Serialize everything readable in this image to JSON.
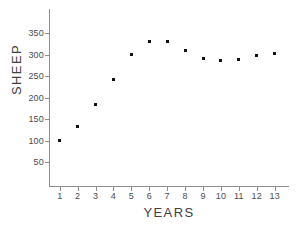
{
  "chart_data": {
    "type": "scatter",
    "title": "",
    "xlabel": "YEARS",
    "ylabel": "SHEEP",
    "x": [
      1,
      2,
      3,
      4,
      5,
      6,
      7,
      8,
      9,
      10,
      11,
      12,
      13
    ],
    "values": [
      100,
      133,
      183,
      243,
      300,
      330,
      330,
      310,
      290,
      285,
      288,
      298,
      303
    ],
    "series": [
      {
        "name": "SHEEP",
        "values": [
          100,
          133,
          183,
          243,
          300,
          330,
          330,
          310,
          290,
          285,
          288,
          298,
          303
        ]
      }
    ],
    "xlim": [
      0.4,
      13.8
    ],
    "ylim": [
      0,
      375
    ],
    "xticks": [
      1,
      2,
      3,
      4,
      5,
      6,
      7,
      8,
      9,
      10,
      11,
      12,
      13
    ],
    "xticklabels": [
      "1",
      "2",
      "3",
      "4",
      "5",
      "6",
      "7",
      "8",
      "9",
      "10",
      "11",
      "12",
      "13"
    ],
    "yticks": [
      50,
      100,
      150,
      200,
      250,
      300,
      350
    ],
    "yticklabels": [
      "50",
      "100",
      "150",
      "200",
      "250",
      "300",
      "350"
    ],
    "grid": false,
    "legend": null,
    "marker": "square",
    "marker_color": "#111111",
    "axis_color": "#8f8f8f",
    "background_color": "#ffffff"
  },
  "axes": {
    "y_title": "SHEEP",
    "x_title": "YEARS"
  }
}
